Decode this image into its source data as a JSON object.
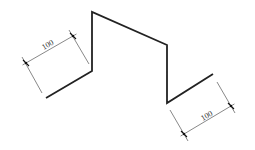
{
  "diagram": {
    "type": "technical-drawing",
    "colors": {
      "profile": "#222222",
      "dimension": "#555555",
      "text": "#333333",
      "background": "#ffffff"
    },
    "profile": {
      "points": [
        [
          46,
          98
        ],
        [
          92,
          71
        ],
        [
          92,
          12
        ],
        [
          167,
          45
        ],
        [
          167,
          103
        ],
        [
          213,
          74
        ]
      ]
    },
    "dimensions": [
      {
        "id": "left",
        "label": "100",
        "start": [
          26,
          63
        ],
        "end": [
          73,
          36
        ],
        "ext1": [
          [
            22,
            57
          ],
          [
            42,
            93
          ]
        ],
        "ext2": [
          [
            69,
            30
          ],
          [
            89,
            64
          ]
        ],
        "text_pos": [
          49,
          47
        ],
        "angle": -30
      },
      {
        "id": "right",
        "label": "100",
        "start": [
          184,
          134
        ],
        "end": [
          231,
          106
        ],
        "ext1": [
          [
            170,
            110
          ],
          [
            188,
            141
          ]
        ],
        "ext2": [
          [
            217,
            82
          ],
          [
            235,
            113
          ]
        ],
        "text_pos": [
          208,
          118
        ],
        "angle": -30
      }
    ]
  }
}
